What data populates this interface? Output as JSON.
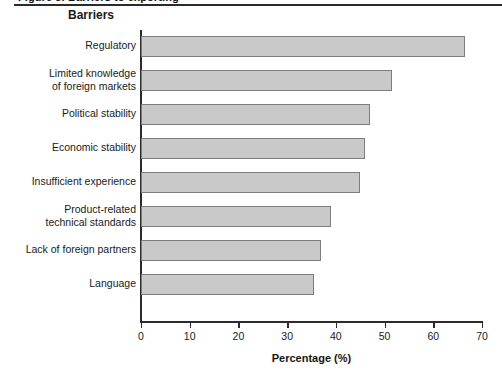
{
  "figure": {
    "caption_remnant": "Figure 3. Barriers to exporting",
    "title": "Barriers"
  },
  "chart_data": {
    "type": "bar",
    "orientation": "horizontal",
    "title": "Barriers",
    "xlabel": "Percentage (%)",
    "ylabel": "",
    "xlim": [
      0,
      70
    ],
    "xticks": [
      0,
      10,
      20,
      30,
      40,
      50,
      60,
      70
    ],
    "xtick_labels": [
      "0",
      "10",
      "20",
      "30",
      "40",
      "50",
      "60",
      "70"
    ],
    "grid": false,
    "legend": false,
    "bar_color": "#c9c9c9",
    "bar_edge_color": "#7d7d7d",
    "categories": [
      "Regulatory",
      "Limited knowledge\nof foreign markets",
      "Political stability",
      "Economic stability",
      "Insufficient experience",
      "Product-related\ntechnical standards",
      "Lack of foreign partners",
      "Language"
    ],
    "values": [
      66.5,
      51.5,
      47,
      46,
      45,
      39,
      37,
      35.5
    ]
  }
}
